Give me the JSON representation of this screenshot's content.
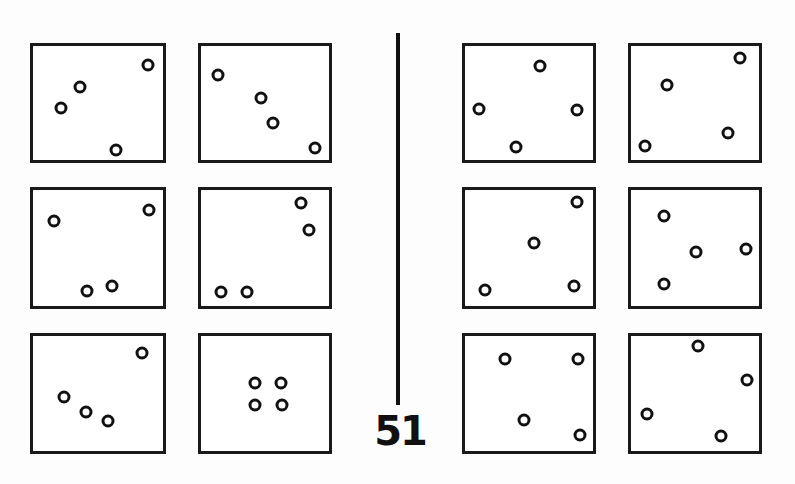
{
  "figure": {
    "label": "51",
    "divider": "vertical-line",
    "groups": [
      {
        "name": "left-group",
        "panels": [
          {
            "id": "L1",
            "x": 30,
            "y": 43,
            "w": 136,
            "h": 120,
            "dots": [
              [
                148,
                65
              ],
              [
                80,
                87
              ],
              [
                61,
                108
              ],
              [
                116,
                150
              ]
            ]
          },
          {
            "id": "L2",
            "x": 198,
            "y": 43,
            "w": 134,
            "h": 120,
            "dots": [
              [
                218,
                75
              ],
              [
                261,
                98
              ],
              [
                273,
                123
              ],
              [
                315,
                148
              ]
            ]
          },
          {
            "id": "L3",
            "x": 30,
            "y": 187,
            "w": 136,
            "h": 122,
            "dots": [
              [
                149,
                210
              ],
              [
                54,
                221
              ],
              [
                112,
                286
              ],
              [
                87,
                291
              ]
            ]
          },
          {
            "id": "L4",
            "x": 198,
            "y": 187,
            "w": 134,
            "h": 122,
            "dots": [
              [
                301,
                203
              ],
              [
                309,
                230
              ],
              [
                221,
                292
              ],
              [
                247,
                292
              ]
            ]
          },
          {
            "id": "L5",
            "x": 30,
            "y": 333,
            "w": 136,
            "h": 121,
            "dots": [
              [
                142,
                353
              ],
              [
                64,
                397
              ],
              [
                86,
                412
              ],
              [
                108,
                421
              ]
            ]
          },
          {
            "id": "L6",
            "x": 198,
            "y": 333,
            "w": 134,
            "h": 121,
            "dots": [
              [
                255,
                383
              ],
              [
                281,
                383
              ],
              [
                255,
                405
              ],
              [
                282,
                405
              ]
            ]
          }
        ]
      },
      {
        "name": "right-group",
        "panels": [
          {
            "id": "R1",
            "x": 462,
            "y": 43,
            "w": 134,
            "h": 120,
            "dots": [
              [
                540,
                66
              ],
              [
                479,
                109
              ],
              [
                577,
                110
              ],
              [
                516,
                147
              ]
            ]
          },
          {
            "id": "R2",
            "x": 628,
            "y": 43,
            "w": 134,
            "h": 120,
            "dots": [
              [
                740,
                58
              ],
              [
                667,
                85
              ],
              [
                728,
                133
              ],
              [
                645,
                146
              ]
            ]
          },
          {
            "id": "R3",
            "x": 462,
            "y": 187,
            "w": 134,
            "h": 122,
            "dots": [
              [
                577,
                202
              ],
              [
                534,
                243
              ],
              [
                485,
                290
              ],
              [
                574,
                286
              ]
            ]
          },
          {
            "id": "R4",
            "x": 628,
            "y": 187,
            "w": 134,
            "h": 122,
            "dots": [
              [
                664,
                216
              ],
              [
                696,
                252
              ],
              [
                746,
                249
              ],
              [
                664,
                284
              ]
            ]
          },
          {
            "id": "R5",
            "x": 462,
            "y": 333,
            "w": 134,
            "h": 121,
            "dots": [
              [
                505,
                359
              ],
              [
                578,
                359
              ],
              [
                524,
                420
              ],
              [
                580,
                435
              ]
            ]
          },
          {
            "id": "R6",
            "x": 628,
            "y": 333,
            "w": 134,
            "h": 121,
            "dots": [
              [
                698,
                346
              ],
              [
                747,
                380
              ],
              [
                647,
                414
              ],
              [
                721,
                436
              ]
            ]
          }
        ]
      }
    ]
  }
}
